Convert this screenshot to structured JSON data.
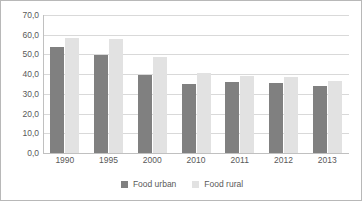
{
  "chart_data": {
    "type": "bar",
    "title": "",
    "subtitle": "",
    "xlabel": "",
    "ylabel": "",
    "categories": [
      "1990",
      "1995",
      "2000",
      "2010",
      "2011",
      "2012",
      "2013"
    ],
    "series": [
      {
        "name": "Food urban",
        "color": "#808080",
        "values": [
          54.0,
          49.7,
          39.4,
          35.2,
          35.8,
          35.5,
          34.2
        ]
      },
      {
        "name": "Food rural",
        "color": "#e2e2e2",
        "values": [
          58.5,
          57.8,
          48.6,
          40.4,
          39.1,
          38.5,
          36.7
        ]
      }
    ],
    "ylim": [
      0,
      70
    ],
    "ytick_values": [
      0,
      10,
      20,
      30,
      40,
      50,
      60,
      70
    ],
    "ytick_labels": [
      "0,0",
      "10,0",
      "20,0",
      "30,0",
      "40,0",
      "50,0",
      "60,0",
      "70,0"
    ],
    "grid": true,
    "grid_axis": "y",
    "legend": [
      "Food urban",
      "Food rural"
    ],
    "legend_position": "bottom",
    "decimal_separator": ","
  },
  "style": {
    "grid_color": "#d9d9d9",
    "axis_color": "#c0c0c0",
    "text_color": "#595959",
    "frame_color": "#b8b8b8",
    "background": "#ffffff"
  }
}
